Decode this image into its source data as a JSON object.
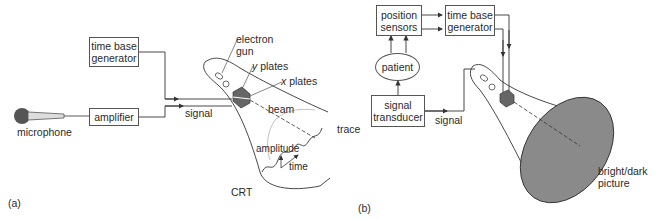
{
  "panel_a": {
    "label": "(a)",
    "microphone": "microphone",
    "amplifier": "amplifier",
    "time_base_line1": "time base",
    "time_base_line2": "generator",
    "signal": "signal",
    "electron_gun_line1": "electron",
    "electron_gun_line2": "gun",
    "y_plates_var": "y",
    "y_plates_text": " plates",
    "x_plates_var": "x",
    "x_plates_text": " plates",
    "beam": "beam",
    "trace": "trace",
    "amplitude": "amplitude",
    "time": "time",
    "crt": "CRT"
  },
  "panel_b": {
    "label": "(b)",
    "position_sensors_line1": "position",
    "position_sensors_line2": "sensors",
    "time_base_line1": "time base",
    "time_base_line2": "generator",
    "patient": "patient",
    "signal_transducer_line1": "signal",
    "signal_transducer_line2": "transducer",
    "signal": "signal",
    "screen_line1": "bright/dark",
    "screen_line2": "picture"
  },
  "colors": {
    "line": "#333333",
    "screen_fill": "#8a8a8a",
    "plates_fill": "#666666"
  }
}
